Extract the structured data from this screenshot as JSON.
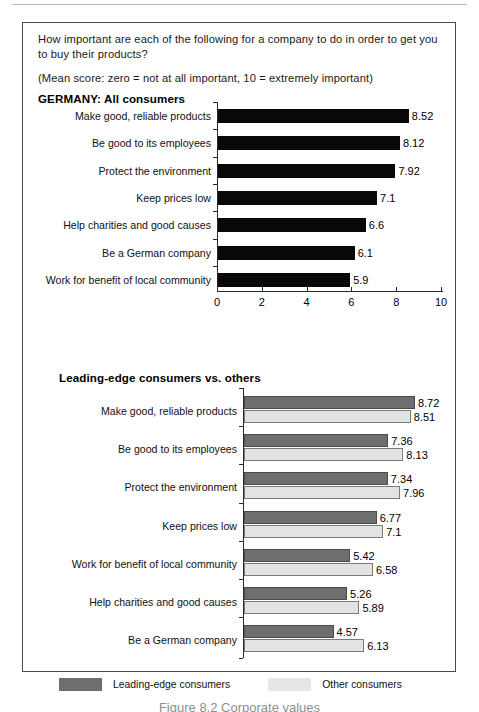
{
  "intro": {
    "question": "How important are each of the following for a company to do in order to get you to buy their products?",
    "scale_note": "(Mean score: zero = not at all important, 10 = extremely important)"
  },
  "sections": {
    "germany_title": "GERMANY: All consumers",
    "leading_title": "Leading-edge consumers vs. others"
  },
  "legend": {
    "dark_label": "Leading-edge consumers",
    "light_label": "Other consumers",
    "dark_color": "#6e6e6e",
    "light_color": "#e6e6e6"
  },
  "caption": {
    "text": "Figure 8.2  Corporate values"
  },
  "chart_data": [
    {
      "type": "bar",
      "title": "GERMANY: All consumers",
      "orientation": "horizontal",
      "xlabel": "",
      "ylabel": "",
      "xlim": [
        0,
        10
      ],
      "xticks": [
        "0",
        "2",
        "4",
        "6",
        "8",
        "10"
      ],
      "grid": false,
      "legend": "none",
      "bar_color": "#080808",
      "categories": [
        "Make good, reliable products",
        "Be good to its employees",
        "Protect the environment",
        "Keep prices low",
        "Help charities and good causes",
        "Be a German company",
        "Work for benefit of local community"
      ],
      "values": [
        8.52,
        8.12,
        7.92,
        7.1,
        6.6,
        6.1,
        5.9
      ],
      "value_labels": [
        "8.52",
        "8.12",
        "7.92",
        "7.1",
        "6.6",
        "6.1",
        "5.9"
      ]
    },
    {
      "type": "bar",
      "title": "Leading-edge consumers vs. others",
      "orientation": "horizontal",
      "xlabel": "",
      "ylabel": "",
      "xlim": [
        0,
        10
      ],
      "xticks": [],
      "grid": false,
      "legend": "bottom",
      "categories": [
        "Make good, reliable products",
        "Be good to its employees",
        "Protect the environment",
        "Keep prices low",
        "Work for benefit of local community",
        "Help charities and good causes",
        "Be a German company"
      ],
      "series": [
        {
          "name": "Leading-edge consumers",
          "color": "#6e6e6e",
          "values": [
            8.72,
            7.36,
            7.34,
            6.77,
            5.42,
            5.26,
            4.57
          ],
          "value_labels": [
            "8.72",
            "7.36",
            "7.34",
            "6.77",
            "5.42",
            "5.26",
            "4.57"
          ]
        },
        {
          "name": "Other consumers",
          "color": "#e3e3e3",
          "values": [
            8.51,
            8.13,
            7.96,
            7.1,
            6.58,
            5.89,
            6.13
          ],
          "value_labels": [
            "8.51",
            "8.13",
            "7.96",
            "7.1",
            "6.58",
            "5.89",
            "6.13"
          ]
        }
      ]
    }
  ]
}
